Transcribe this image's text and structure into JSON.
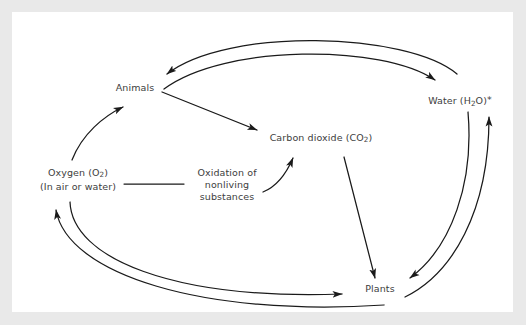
{
  "diagram": {
    "type": "cycle-diagram",
    "background_color": "#e9e9e9",
    "canvas_color": "#ffffff",
    "label_color": "#3d3d3d",
    "arrow_color": "#1a1a1a",
    "nodes": [
      {
        "id": "animals",
        "label": "Animals",
        "x": 123,
        "y": 76
      },
      {
        "id": "water",
        "label": "Water (H",
        "sub": "2",
        "label_after_sub": "O)",
        "star": "*",
        "x": 448,
        "y": 88
      },
      {
        "id": "carbon",
        "label": "Carbon dioxide (CO",
        "sub": "2",
        "label_after_sub": ")",
        "x": 309,
        "y": 126
      },
      {
        "id": "oxygen",
        "label_line1": "Oxygen (O",
        "sub": "2",
        "label_line1_after_sub": ")",
        "label_line2": "(In air or water)",
        "x": 66,
        "y": 167
      },
      {
        "id": "oxidation",
        "label_line1": "Oxidation of",
        "label_line2": "nonliving",
        "label_line3": "substances",
        "x": 215,
        "y": 178
      },
      {
        "id": "plants",
        "label": "Plants",
        "x": 368,
        "y": 277
      }
    ],
    "edges": [
      {
        "id": "water-to-animals",
        "from": "water",
        "to": "animals",
        "style": "curved-arc"
      },
      {
        "id": "animals-to-water",
        "from": "animals",
        "to": "water",
        "style": "curved-arc"
      },
      {
        "id": "animals-to-carbon",
        "from": "animals",
        "to": "carbon",
        "style": "straight"
      },
      {
        "id": "oxygen-to-animals",
        "from": "oxygen",
        "to": "animals",
        "style": "curved"
      },
      {
        "id": "oxygen-to-oxidation",
        "from": "oxygen",
        "to": "oxidation",
        "style": "plain-line"
      },
      {
        "id": "oxidation-to-carbon",
        "from": "oxidation",
        "to": "carbon",
        "style": "curved"
      },
      {
        "id": "carbon-to-plants",
        "from": "carbon",
        "to": "plants",
        "style": "straight"
      },
      {
        "id": "water-to-plants",
        "from": "water",
        "to": "plants",
        "style": "curved-arc"
      },
      {
        "id": "plants-to-water",
        "from": "plants",
        "to": "water",
        "style": "curved-arc"
      },
      {
        "id": "oxygen-to-plants",
        "from": "oxygen",
        "to": "plants",
        "style": "curved-arc"
      },
      {
        "id": "plants-to-oxygen",
        "from": "plants",
        "to": "oxygen",
        "style": "curved-arc"
      }
    ]
  }
}
